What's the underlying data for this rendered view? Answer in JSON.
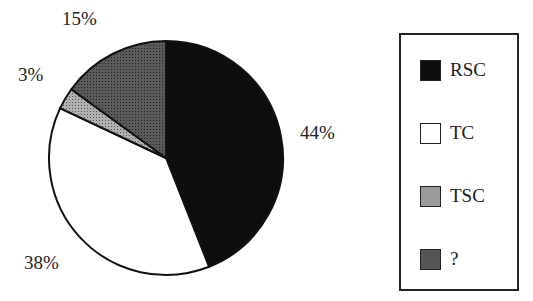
{
  "chart_data": {
    "type": "pie",
    "title": "",
    "categories": [
      "RSC",
      "TC",
      "TSC",
      "?"
    ],
    "values": [
      44,
      38,
      3,
      15
    ],
    "labels": [
      "44%",
      "38%",
      "3%",
      "15%"
    ],
    "colors": [
      "#0d0d0d",
      "#ffffff",
      "#9a9a9a",
      "#555555"
    ],
    "start_angle_deg": 0,
    "direction": "clockwise",
    "legend_position": "right"
  },
  "labels": {
    "rsc": "44%",
    "tc": "38%",
    "tsc": "3%",
    "unknown": "15%"
  },
  "legend": {
    "items": [
      {
        "label": "RSC",
        "color": "#0d0d0d"
      },
      {
        "label": "TC",
        "color": "#ffffff"
      },
      {
        "label": "TSC",
        "color": "#9a9a9a"
      },
      {
        "label": "?",
        "color": "#555555"
      }
    ]
  }
}
